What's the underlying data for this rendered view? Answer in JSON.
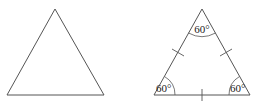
{
  "diagram": {
    "colors": {
      "stroke": "#555555",
      "text": "#222222",
      "background": "#ffffff"
    },
    "left_triangle": {
      "vertices": [
        [
          55,
          9
        ],
        [
          7,
          95
        ],
        [
          104,
          95
        ]
      ]
    },
    "right_triangle": {
      "vertices": [
        [
          202,
          9
        ],
        [
          154,
          95
        ],
        [
          250,
          95
        ]
      ],
      "angle_labels": {
        "top": "60°",
        "bottom_left": "60°",
        "bottom_right": "60°"
      },
      "tick_marks": 3
    }
  }
}
